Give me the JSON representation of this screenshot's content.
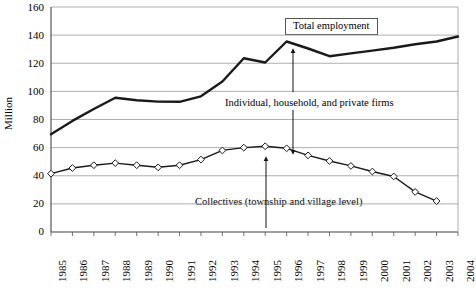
{
  "chart_data": {
    "type": "line",
    "title": "",
    "xlabel": "",
    "ylabel": "Million",
    "xlim": [
      1985,
      2004
    ],
    "ylim": [
      0,
      160
    ],
    "ytick_step": 20,
    "yticks": [
      0,
      20,
      40,
      60,
      80,
      100,
      120,
      140,
      160
    ],
    "grid": "horizontal",
    "legend": "none",
    "categories": [
      1985,
      1986,
      1987,
      1988,
      1989,
      1990,
      1991,
      1992,
      1993,
      1994,
      1995,
      1996,
      1997,
      1998,
      1999,
      2000,
      2001,
      2002,
      2003
    ],
    "xticks": [
      "1985",
      "1986",
      "1987",
      "1988",
      "1989",
      "1990",
      "1991",
      "1992",
      "1993",
      "1994",
      "1995",
      "1996",
      "1997",
      "1998",
      "1999",
      "2000",
      "2001",
      "2002",
      "2003",
      "2004"
    ],
    "series": [
      {
        "name": "Total employment",
        "marker": "none",
        "linewidth": 2.4,
        "color": "#1a1a1a",
        "values": [
          69.5,
          79.0,
          87.5,
          95.5,
          93.7,
          92.7,
          92.6,
          96.5,
          107.0,
          123.5,
          120.5,
          135.5,
          130.5,
          125.0,
          127.0,
          129.0,
          131.0,
          133.5,
          135.5
        ]
      },
      {
        "name": "Collectives (township and village level)",
        "marker": "diamond",
        "linewidth": 1.4,
        "color": "#1a1a1a",
        "marker_fill": "#ffffff",
        "values": [
          41.5,
          45.5,
          47.5,
          49.0,
          47.5,
          46.0,
          47.5,
          51.5,
          58.0,
          60.0,
          61.0,
          59.5,
          54.5,
          50.5,
          47.0,
          43.0,
          39.5,
          28.5,
          22.0
        ]
      }
    ],
    "total_employment_last_point": {
      "x": 2004,
      "y": 139.0
    },
    "annotations": [
      {
        "text": "Total employment",
        "boxed": true
      },
      {
        "text": "Individual, household, and private firms",
        "boxed": false
      },
      {
        "text": "Collectives (township and village level)",
        "boxed": false
      }
    ]
  },
  "axis": {
    "y_title": "Million",
    "y_labels": [
      "160",
      "140",
      "120",
      "100",
      "80",
      "60",
      "40",
      "20",
      "0"
    ],
    "x_labels": [
      "1985",
      "1986",
      "1987",
      "1988",
      "1989",
      "1990",
      "1991",
      "1992",
      "1993",
      "1994",
      "1995",
      "1996",
      "1997",
      "1998",
      "1999",
      "2000",
      "2001",
      "2002",
      "2003",
      "2004"
    ]
  },
  "annotations": {
    "total_employment": "Total employment",
    "individual": "Individual, household, and private firms",
    "collectives": "Collectives (township and village level)"
  }
}
